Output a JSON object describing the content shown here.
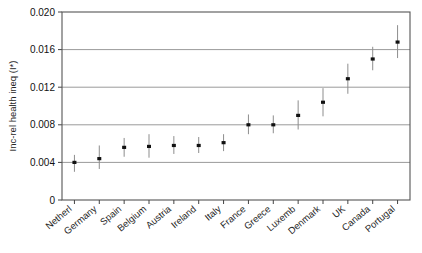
{
  "chart_data": {
    "type": "scatter",
    "title": "",
    "xlabel": "",
    "ylabel": "Inc-rel health ineq (I*)",
    "ylim": [
      0,
      0.02
    ],
    "yticks": [
      0,
      0.004,
      0.008,
      0.012,
      0.016,
      0.02
    ],
    "ytick_labels": [
      "0",
      "0.004",
      "0.008",
      "0.012",
      "0.016",
      "0.020"
    ],
    "grid": true,
    "grid_axis": "y",
    "legend": "none",
    "error_bars": "vertical",
    "categories": [
      "Netherl",
      "Germany",
      "Spain",
      "Belgium",
      "Austria",
      "Ireland",
      "Italy",
      "France",
      "Greece",
      "Luxemb",
      "Denmark",
      "UK",
      "Canada",
      "Portugal"
    ],
    "values": [
      0.004,
      0.0044,
      0.0056,
      0.0057,
      0.0058,
      0.0058,
      0.0061,
      0.008,
      0.008,
      0.009,
      0.0104,
      0.0129,
      0.015,
      0.0168
    ],
    "error_low": [
      0.003,
      0.0033,
      0.0046,
      0.0045,
      0.0049,
      0.005,
      0.0052,
      0.007,
      0.0071,
      0.0075,
      0.0089,
      0.0113,
      0.0138,
      0.0151
    ],
    "error_high": [
      0.0048,
      0.0058,
      0.0066,
      0.007,
      0.0068,
      0.0067,
      0.007,
      0.0091,
      0.009,
      0.0106,
      0.0119,
      0.0145,
      0.0163,
      0.0186
    ]
  },
  "style": {
    "marker_color": "#111111",
    "errorbar_color": "#8d8d8d",
    "grid_color": "#9a9a9a",
    "frame_color": "#555555",
    "background": "#ffffff"
  }
}
